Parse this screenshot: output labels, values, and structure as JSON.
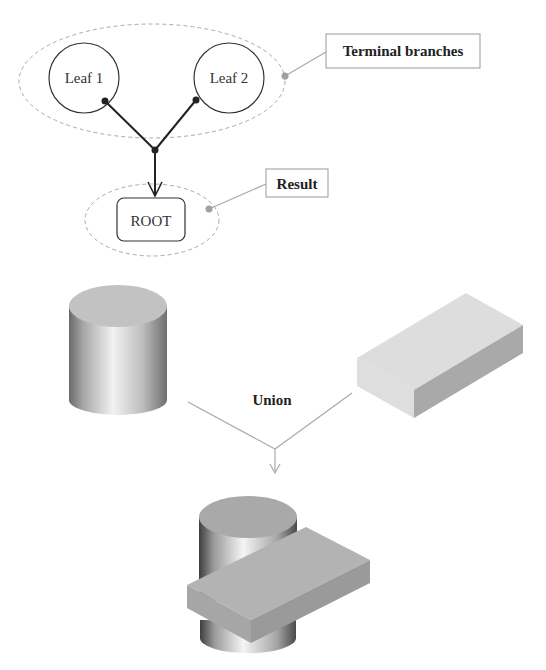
{
  "tree": {
    "leaves": [
      {
        "label": "Leaf 1"
      },
      {
        "label": "Leaf 2"
      }
    ],
    "root": {
      "label": "ROOT"
    },
    "callouts": {
      "terminal_branches": "Terminal branches",
      "result": "Result"
    }
  },
  "csg": {
    "operation": "Union",
    "operands": [
      "cylinder",
      "box"
    ],
    "result": "cylinder-box-union"
  },
  "colors": {
    "line_dark": "#222222",
    "dashed_ellipse": "#aaaaaa",
    "callout_line": "#aaaaaa",
    "callout_border": "#999999",
    "solid_gray": "#b8b8b8"
  }
}
